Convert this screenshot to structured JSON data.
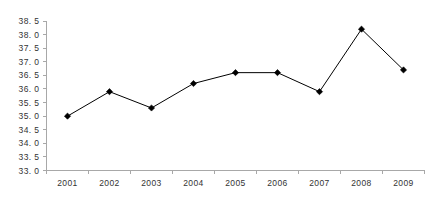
{
  "chart_data": {
    "type": "line",
    "title": "",
    "subtitle": "",
    "xlabel": "",
    "ylabel": "",
    "categories": [
      "2001",
      "2002",
      "2003",
      "2004",
      "2005",
      "2006",
      "2007",
      "2008",
      "2009"
    ],
    "values": [
      35.0,
      35.9,
      35.3,
      36.2,
      36.6,
      36.6,
      35.9,
      38.2,
      36.7
    ],
    "series": [
      {
        "name": "",
        "values": [
          35.0,
          35.9,
          35.3,
          36.2,
          36.6,
          36.6,
          35.9,
          38.2,
          36.7
        ]
      }
    ],
    "ylim": [
      33.0,
      38.5
    ],
    "xlim_categories": [
      "2001",
      "2009"
    ],
    "y_ticks": [
      33.0,
      33.5,
      34.0,
      34.5,
      35.0,
      35.5,
      36.0,
      36.5,
      37.0,
      37.5,
      38.0,
      38.5
    ],
    "y_tick_labels": [
      "33. 0",
      "33. 5",
      "34. 0",
      "34. 5",
      "35. 0",
      "35. 5",
      "36. 0",
      "36. 5",
      "37. 0",
      "37. 5",
      "38. 0",
      "38. 5"
    ],
    "x_tick_labels": [
      "2001",
      "2002",
      "2003",
      "2004",
      "2005",
      "2006",
      "2007",
      "2008",
      "2009"
    ],
    "grid": false,
    "legend": false,
    "legend_position": "none",
    "marker": "diamond",
    "line_color": "#000000",
    "marker_color": "#000000",
    "axis_color": "#a8a8a8",
    "background_color": "#ffffff",
    "annotations": []
  },
  "labels": {
    "y_axis_name": "y-axis",
    "x_axis_name": "x-axis",
    "plot_area_name": "plot-area"
  }
}
